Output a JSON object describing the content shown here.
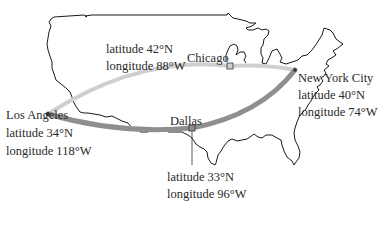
{
  "map": {
    "region": "Continental United States",
    "colors": {
      "outline": "#1a1a1a",
      "route_light": "#cfcfcf",
      "route_dark": "#8f8f8f",
      "text": "#2a2a2a"
    },
    "cities": [
      {
        "name": "Los Angeles",
        "latitude": "latitude 34°N",
        "longitude": "longitude 118°W"
      },
      {
        "name": "Chicago",
        "latitude": "latitude 42°N",
        "longitude": "longitude 88°W"
      },
      {
        "name": "New York City",
        "latitude": "latitude 40°N",
        "longitude": "longitude 74°W"
      },
      {
        "name": "Dallas",
        "latitude": "latitude 33°N",
        "longitude": "longitude 96°W"
      }
    ],
    "routes": [
      {
        "from": "Los Angeles",
        "to": "New York City",
        "via": "Chicago",
        "style": "light"
      },
      {
        "from": "Los Angeles",
        "to": "New York City",
        "via": "Dallas",
        "style": "dark"
      }
    ]
  }
}
